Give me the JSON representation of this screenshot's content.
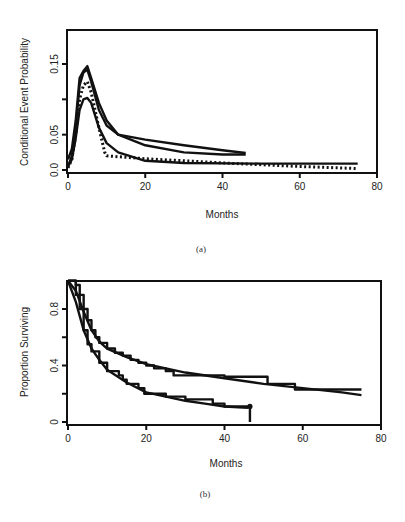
{
  "chart_data": [
    {
      "id": "a",
      "type": "line",
      "caption": "(a)",
      "title": "",
      "xlabel": "Months",
      "ylabel": "Conditional Event Probability",
      "xlim": [
        0,
        80
      ],
      "ylim": [
        0,
        0.19
      ],
      "xticks": [
        "0",
        "20",
        "40",
        "60",
        "80"
      ],
      "yticks": [
        "0.0",
        "0.05",
        "0.15"
      ],
      "ytick_values": [
        0.0,
        0.05,
        0.1,
        0.15
      ],
      "grid": false,
      "legend": null,
      "series": [
        {
          "name": "solid-curve-1",
          "style": "solid",
          "x": [
            0,
            1,
            2,
            3,
            4,
            5,
            6,
            8,
            10,
            13,
            20,
            30,
            40,
            46
          ],
          "y": [
            0.015,
            0.03,
            0.07,
            0.13,
            0.14,
            0.147,
            0.13,
            0.095,
            0.07,
            0.05,
            0.043,
            0.035,
            0.028,
            0.024
          ]
        },
        {
          "name": "solid-curve-2",
          "style": "solid",
          "x": [
            0,
            1,
            2,
            3,
            4,
            5,
            6,
            8,
            10,
            13,
            20,
            30,
            40,
            46
          ],
          "y": [
            0.005,
            0.02,
            0.06,
            0.12,
            0.138,
            0.142,
            0.125,
            0.085,
            0.063,
            0.05,
            0.035,
            0.025,
            0.022,
            0.022
          ]
        },
        {
          "name": "solid-curve-3",
          "style": "solid",
          "x": [
            0,
            1,
            2,
            3,
            4,
            5,
            6,
            8,
            10,
            13,
            20,
            30,
            50,
            75
          ],
          "y": [
            0.005,
            0.015,
            0.045,
            0.085,
            0.1,
            0.102,
            0.095,
            0.06,
            0.038,
            0.025,
            0.013,
            0.01,
            0.009,
            0.009
          ]
        },
        {
          "name": "dotted-curve",
          "style": "dotted",
          "x": [
            0,
            1,
            2,
            3,
            4,
            5,
            6,
            8,
            9.5,
            10,
            20,
            40,
            60,
            75
          ],
          "y": [
            0.003,
            0.015,
            0.05,
            0.1,
            0.12,
            0.125,
            0.11,
            0.06,
            0.025,
            0.02,
            0.016,
            0.01,
            0.005,
            0.002
          ]
        }
      ]
    },
    {
      "id": "b",
      "type": "line",
      "caption": "(b)",
      "title": "",
      "xlabel": "Months",
      "ylabel": "Proportion Surviving",
      "xlim": [
        0,
        80
      ],
      "ylim": [
        0,
        1.0
      ],
      "xticks": [
        "0",
        "20",
        "40",
        "60",
        "80"
      ],
      "yticks": [
        "0",
        "0.4",
        "0.8"
      ],
      "ytick_values": [
        0,
        0.2,
        0.4,
        0.6,
        0.8
      ],
      "grid": false,
      "legend": null,
      "series": [
        {
          "name": "upper-km-step",
          "style": "step",
          "x": [
            0,
            2,
            3,
            4,
            5,
            6,
            7,
            8,
            10,
            12,
            14,
            16,
            18,
            20,
            22,
            25,
            27,
            30,
            40,
            51,
            51,
            58,
            58,
            75
          ],
          "y": [
            1.0,
            0.97,
            0.9,
            0.8,
            0.72,
            0.65,
            0.6,
            0.56,
            0.52,
            0.49,
            0.47,
            0.44,
            0.42,
            0.4,
            0.38,
            0.36,
            0.33,
            0.33,
            0.32,
            0.32,
            0.27,
            0.27,
            0.23,
            0.23
          ]
        },
        {
          "name": "upper-fitted",
          "style": "solid",
          "x": [
            0,
            2,
            4,
            6,
            8,
            10,
            15,
            20,
            30,
            40,
            50,
            60,
            70,
            75
          ],
          "y": [
            1.0,
            0.93,
            0.78,
            0.65,
            0.57,
            0.52,
            0.46,
            0.41,
            0.35,
            0.31,
            0.27,
            0.24,
            0.21,
            0.19
          ]
        },
        {
          "name": "lower-km-step",
          "style": "step",
          "x": [
            0,
            2,
            3,
            4,
            5,
            6,
            8,
            10,
            13,
            14,
            15,
            18,
            19.5,
            20,
            25,
            30,
            36,
            37,
            40,
            46.5,
            46.5
          ],
          "y": [
            1.0,
            0.9,
            0.8,
            0.65,
            0.55,
            0.5,
            0.42,
            0.36,
            0.33,
            0.3,
            0.27,
            0.24,
            0.2,
            0.2,
            0.18,
            0.16,
            0.16,
            0.13,
            0.11,
            0.1,
            0.0
          ]
        },
        {
          "name": "lower-fitted",
          "style": "solid",
          "x": [
            0,
            2,
            4,
            6,
            8,
            10,
            15,
            20,
            25,
            30,
            35,
            40,
            46
          ],
          "y": [
            1.0,
            0.85,
            0.65,
            0.52,
            0.44,
            0.37,
            0.28,
            0.21,
            0.18,
            0.15,
            0.13,
            0.11,
            0.1
          ]
        }
      ]
    }
  ]
}
